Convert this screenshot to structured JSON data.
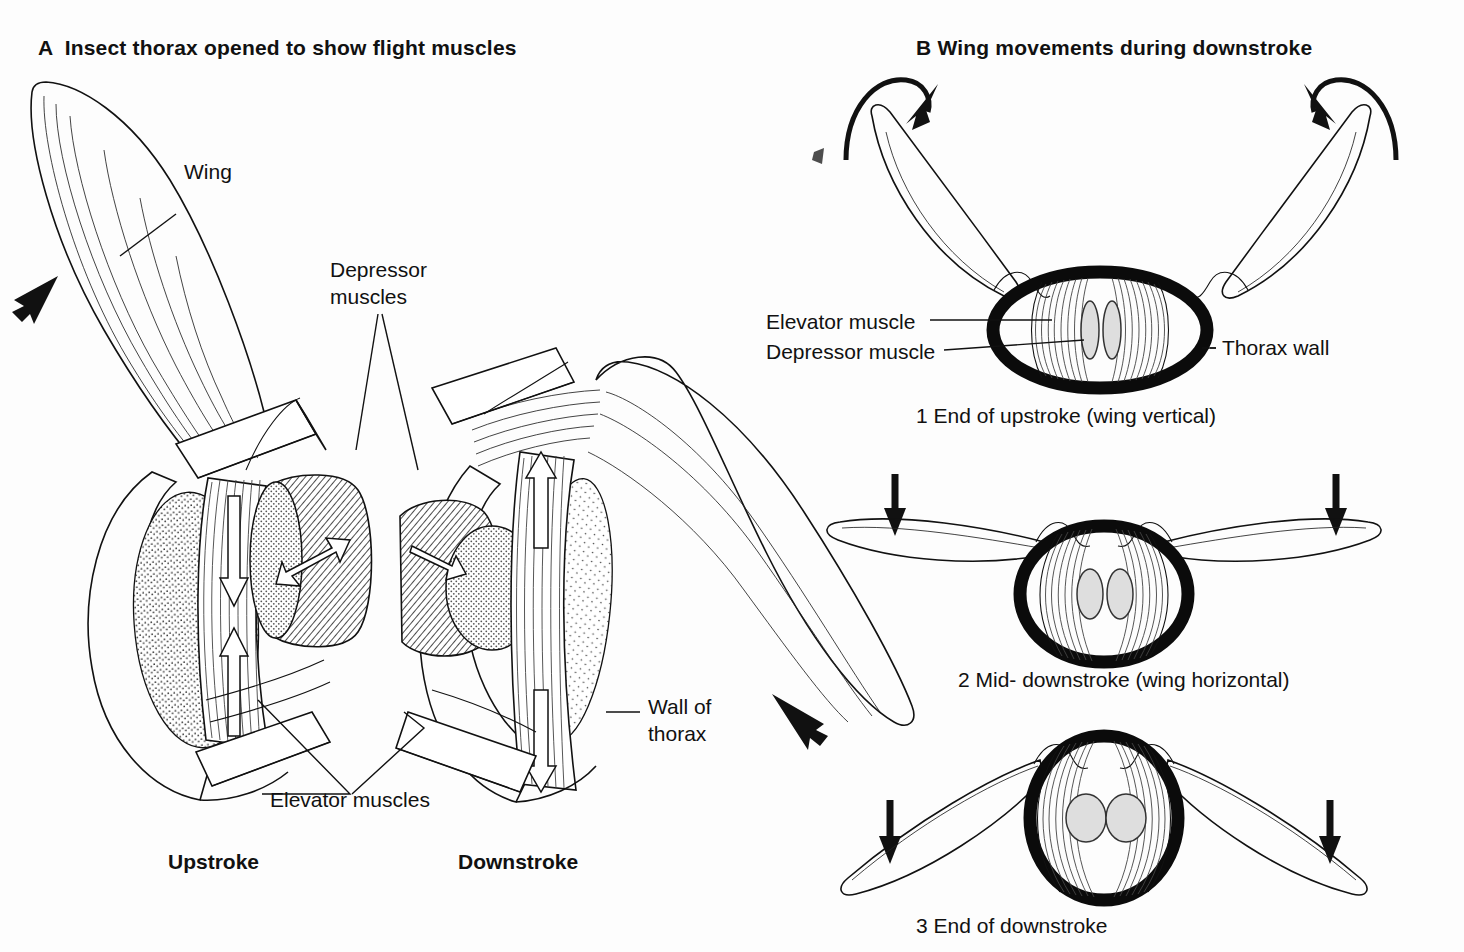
{
  "figure": {
    "background_color": "#fdfdfd",
    "ink_color": "#111111",
    "muscle_fill_color": "#dedede"
  },
  "panel_a": {
    "title": "A  Insect thorax opened to show flight muscles",
    "title_letter": "A",
    "annotations": {
      "wing": "Wing",
      "depressor_line1": "Depressor",
      "depressor_line2": "muscles",
      "elevator": "Elevator muscles",
      "wall_line1": "Wall of",
      "wall_line2": "thorax"
    },
    "states": {
      "upstroke": "Upstroke",
      "downstroke": "Downstroke"
    }
  },
  "panel_b": {
    "title": "B Wing movements during downstroke",
    "title_letter": "B",
    "annotations": {
      "elevator_muscle": "Elevator muscle",
      "depressor_muscle": "Depressor muscle",
      "thorax_wall": "Thorax wall"
    },
    "stages": [
      {
        "number": "1",
        "caption": "1 End of upstroke (wing vertical)"
      },
      {
        "number": "2",
        "caption": "2 Mid- downstroke (wing horizontal)"
      },
      {
        "number": "3",
        "caption": "3 End of downstroke"
      }
    ]
  }
}
